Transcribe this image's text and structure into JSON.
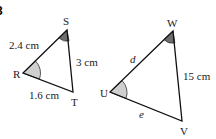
{
  "question_number": "3",
  "triangles": [
    {
      "name": "RST",
      "vertices": [
        "S",
        "R",
        "T"
      ],
      "sides": {
        "RS": "2.4 cm",
        "ST": "3 cm",
        "RT": "1.6 cm"
      },
      "marked_angles": {
        "R": "light",
        "S": "dark"
      }
    },
    {
      "name": "UVW",
      "vertices": [
        "W",
        "U",
        "V"
      ],
      "sides": {
        "UW": "d",
        "WV": "15 cm",
        "UV": "e"
      },
      "marked_angles": {
        "U": "light",
        "W": "dark"
      }
    }
  ],
  "colors": {
    "light_angle": "#cfcfcf",
    "dark_angle": "#6e6e6e"
  }
}
